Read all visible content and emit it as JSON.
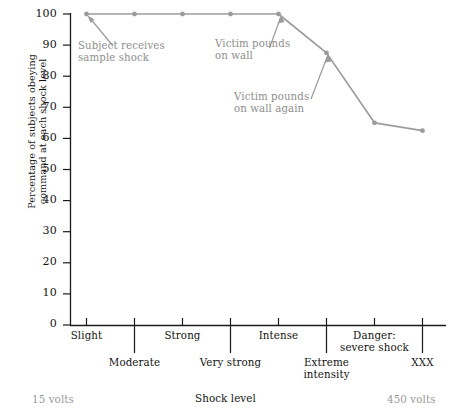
{
  "chart_data": {
    "type": "line",
    "title": "",
    "xlabel": "Shock level",
    "ylabel": "Percentage of subjects obeying command at each shock level",
    "ylim": [
      0,
      100
    ],
    "grid": false,
    "legend": "none",
    "categories": [
      "Slight",
      "Moderate",
      "Strong",
      "Very strong",
      "Intense",
      "Extreme intensity",
      "Danger: severe shock",
      "XXX"
    ],
    "values": [
      100,
      100,
      100,
      100,
      100,
      87.5,
      65,
      62.5
    ],
    "series": [
      {
        "name": "Percentage obeying",
        "values": [
          100,
          100,
          100,
          100,
          100,
          87.5,
          65,
          62.5
        ]
      }
    ],
    "y_ticks": [
      0,
      10,
      20,
      30,
      40,
      50,
      60,
      70,
      80,
      90,
      100
    ],
    "x_tick_labels_upper": [
      "Slight",
      "Strong",
      "Intense",
      "Danger: severe shock"
    ],
    "x_tick_labels_lower": [
      "Moderate",
      "Very strong",
      "Extreme intensity",
      "XXX"
    ],
    "axis_range_start_label": "15 volts",
    "axis_range_end_label": "450 volts",
    "annotations": [
      {
        "text": "Subject receives sample shock",
        "points_to_category": "Slight",
        "points_to_value": 100
      },
      {
        "text": "Victim pounds on wall",
        "points_to_category": "Intense",
        "points_to_value": 100
      },
      {
        "text": "Victim pounds on wall again",
        "points_to_category": "Extreme intensity",
        "points_to_value": 87.5
      }
    ],
    "colors": {
      "line": "#9c9c9c",
      "marker": "#9c9c9c",
      "axis": "#1a1a1a",
      "annotation_text": "#8e8e8e",
      "tick_label": "#141414",
      "volts_label": "#9a9a9a"
    }
  },
  "axis": {
    "y_title_line1": "Percentage of subjects obeying",
    "y_title_line2": "command at each shock level",
    "y_labels": [
      "100",
      "90",
      "80",
      "70",
      "60",
      "50",
      "40",
      "30",
      "20",
      "10",
      "0"
    ]
  },
  "x_labels": {
    "slight": "Slight",
    "moderate": "Moderate",
    "strong": "Strong",
    "very_strong": "Very strong",
    "intense": "Intense",
    "extreme_intensity_l1": "Extreme",
    "extreme_intensity_l2": "intensity",
    "danger_l1": "Danger:",
    "danger_l2": "severe shock",
    "xxx": "XXX"
  },
  "annotations": {
    "a1_l1": "Subject receives",
    "a1_l2": "sample shock",
    "a2_l1": "Victim pounds",
    "a2_l2": "on wall",
    "a3_l1": "Victim pounds",
    "a3_l2": "on wall again"
  },
  "footer": {
    "left": "15 volts",
    "center": "Shock level",
    "right": "450 volts"
  }
}
